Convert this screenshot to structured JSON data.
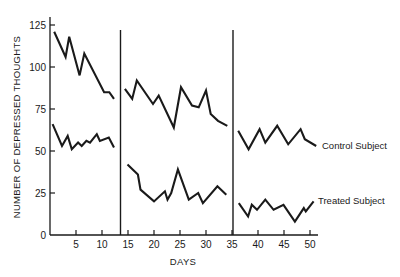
{
  "chart_data": {
    "type": "line",
    "title": "",
    "xlabel": "DAYS",
    "ylabel": "NUMBER OF DEPRESSED THOUGHTS",
    "xlim": [
      0,
      52
    ],
    "ylim": [
      0,
      125
    ],
    "x_ticks": [
      5,
      10,
      15,
      20,
      25,
      30,
      35,
      40,
      45,
      50
    ],
    "y_ticks": [
      0,
      25,
      50,
      75,
      100,
      125
    ],
    "grid": false,
    "legend_position": "inline-right",
    "phase_dividers": [
      13.5,
      35
    ],
    "series": [
      {
        "name": "Control Subject",
        "segments": [
          {
            "x": [
              0.8,
              3.0,
              3.7,
              5.7,
              6.6,
              10.4,
              11.4,
              12.3
            ],
            "y": [
              121,
              106,
              118,
              95,
              108,
              85,
              85,
              81
            ]
          },
          {
            "x": [
              14.4,
              15.8,
              16.7,
              19.8,
              20.9,
              23.8,
              25.2,
              27.3,
              28.6,
              30.0,
              30.9,
              32.3,
              34.1
            ],
            "y": [
              87,
              81,
              92,
              78,
              83,
              64,
              88,
              77,
              76,
              86,
              72,
              68,
              65
            ]
          },
          {
            "x": [
              36.2,
              38.2,
              40.3,
              41.4,
              43.7,
              45.8,
              48.2,
              49.0,
              51.2
            ],
            "y": [
              62,
              51,
              63,
              55,
              65,
              54,
              63,
              57,
              53
            ]
          }
        ]
      },
      {
        "name": "Treated Subject",
        "segments": [
          {
            "x": [
              0.5,
              2.3,
              3.4,
              4.2,
              5.4,
              6.1,
              7.0,
              7.7,
              9.0,
              9.6,
              11.3,
              12.3
            ],
            "y": [
              66,
              53,
              59,
              51,
              55,
              53,
              56,
              55,
              60,
              56,
              58,
              52
            ]
          },
          {
            "x": [
              14.9,
              16.9,
              17.4,
              20.0,
              22.1,
              22.6,
              23.3,
              24.6,
              26.7,
              28.5,
              29.4,
              32.2,
              33.9
            ],
            "y": [
              42,
              36,
              27,
              20,
              26,
              21,
              25,
              39,
              21,
              25,
              19,
              29,
              24
            ]
          },
          {
            "x": [
              36.3,
              38.1,
              38.8,
              39.8,
              41.4,
              43.0,
              44.9,
              47.1,
              48.8,
              49.2,
              50.7
            ],
            "y": [
              19,
              11,
              18,
              15,
              21,
              15,
              18,
              8,
              16,
              14,
              20
            ]
          }
        ]
      }
    ]
  },
  "labels": {
    "xlabel": "DAYS",
    "ylabel": "NUMBER OF DEPRESSED THOUGHTS",
    "control_legend": "Control Subject",
    "treated_legend": "Treated Subject",
    "y_tick_labels": [
      "0",
      "25",
      "50",
      "75",
      "100",
      "125"
    ],
    "x_tick_labels": [
      "5",
      "10",
      "15",
      "20",
      "25",
      "30",
      "35",
      "40",
      "45",
      "50"
    ]
  },
  "colors": {
    "line": "#1a1a1a",
    "background": "#ffffff"
  }
}
